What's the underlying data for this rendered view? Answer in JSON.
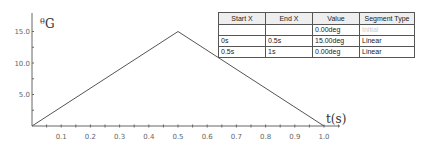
{
  "chart_data": {
    "type": "line",
    "title": "",
    "xlabel": "t(s)",
    "ylabel": "θG",
    "ylabel_parts": {
      "sup": "θ",
      "main": "G"
    },
    "xlim": [
      0,
      1.05
    ],
    "ylim": [
      0,
      16
    ],
    "x_ticks": [
      "0.1",
      "0.2",
      "0.3",
      "0.4",
      "0.5",
      "0.6",
      "0.7",
      "0.8",
      "0.9",
      "1.0"
    ],
    "y_ticks": [
      "5.0",
      "10.0",
      "15.0"
    ],
    "grid": false,
    "series": [
      {
        "name": "θG",
        "x": [
          0,
          0.5,
          1.0
        ],
        "values": [
          0,
          15,
          0
        ],
        "color": "#555555"
      }
    ]
  },
  "table": {
    "headers": [
      "Start X",
      "End X",
      "Value",
      "Segment Type"
    ],
    "rows": [
      [
        "",
        "",
        "0.00deg",
        "Initial"
      ],
      [
        "0s",
        "0.5s",
        "15.00deg",
        "Linear"
      ],
      [
        "0.5s",
        "1s",
        "0.00deg",
        "Linear"
      ]
    ]
  }
}
